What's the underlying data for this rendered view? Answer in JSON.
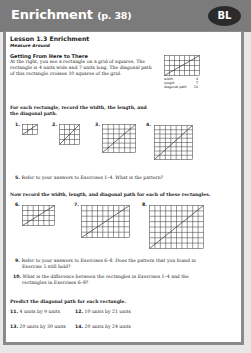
{
  "header": {
    "title": "Enrichment",
    "page_ref": "(p. 38)",
    "badge": "BL",
    "background_color": "#7b7b7b",
    "badge_color": "#2a2a2a"
  },
  "lesson": {
    "title": "Lesson 1.3 Enrichment",
    "subtitle": "Measure Around"
  },
  "intro": {
    "heading": "Getting From Here to There",
    "lines": [
      "At the right, you see a rectangle on a grid of squares. The",
      "rectangle is 4 units wide and 7 units long. The diagonal path",
      "of this rectangle crosses 10 squares of the grid."
    ],
    "example": {
      "width_label": "width",
      "width_value": "4",
      "length_label": "length",
      "length_value": "7",
      "diagonal_label": "diagonal path",
      "diagonal_value": "10"
    }
  },
  "section1": {
    "instructions": [
      "For each rectangle, record the width, the length, and",
      "the diagonal path."
    ],
    "exercises": [
      {
        "num": "1.",
        "cols": 3,
        "rows": 2
      },
      {
        "num": "2.",
        "cols": 4,
        "rows": 4
      },
      {
        "num": "3.",
        "cols": 6,
        "rows": 6
      },
      {
        "num": "4.",
        "cols": 7,
        "rows": 8
      }
    ]
  },
  "q5": {
    "num": "5.",
    "text": "Refer to your answers to Exercises 1–4. What is the pattern?"
  },
  "section2": {
    "instructions": "Now record the width, length, and diagonal path for each of these rectangles.",
    "exercises": [
      {
        "num": "6.",
        "cols": 6,
        "rows": 4
      },
      {
        "num": "7.",
        "cols": 9,
        "rows": 6
      },
      {
        "num": "8.",
        "cols": 10,
        "rows": 8
      }
    ]
  },
  "q9": {
    "num": "9.",
    "lines": [
      "Refer to your answers to Exercises 6–8. Does the pattern that you found in",
      "Exercise 5 still hold?"
    ]
  },
  "q10": {
    "num": "10.",
    "lines": [
      "What is the difference between the rectangles in Exercises 1–4 and the",
      "rectangles in Exercises 6–8?"
    ]
  },
  "section3": {
    "instructions": "Predict the diagonal path for each rectangle.",
    "items": [
      {
        "num": "11.",
        "text": "4 units by 9 units"
      },
      {
        "num": "12.",
        "text": "10 units by 21 units"
      },
      {
        "num": "13.",
        "text": "20 units by 30 units"
      },
      {
        "num": "14.",
        "text": "20 units by 24 units"
      }
    ]
  }
}
